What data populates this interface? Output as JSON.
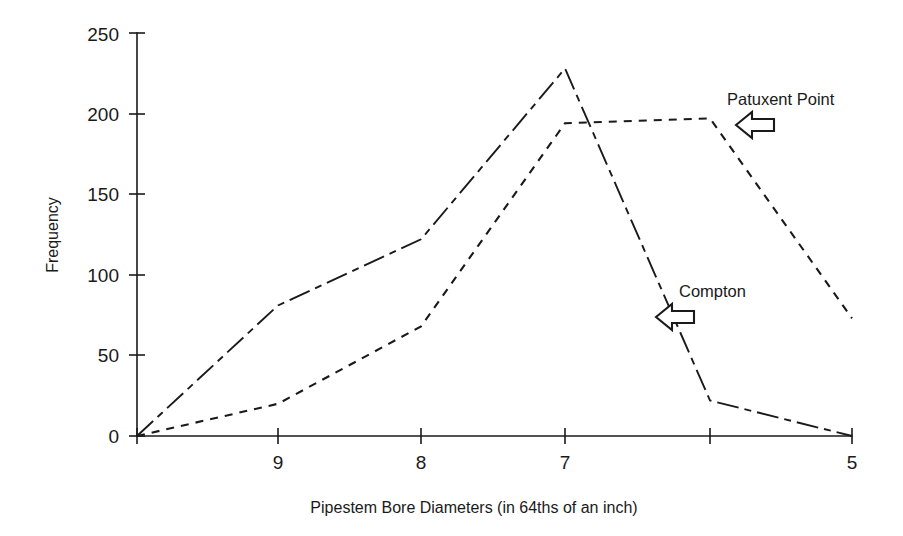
{
  "chart_data": {
    "type": "line",
    "title": "",
    "subtitle": "",
    "xlabel": "Pipestem Bore Diameters (in 64ths of an inch)",
    "ylabel": "Frequency",
    "grid": false,
    "legend_position": "inline-annotations",
    "xlim": [
      0,
      5
    ],
    "ylim": [
      0,
      250
    ],
    "yticks": [
      0,
      50,
      100,
      150,
      200,
      250
    ],
    "ytick_labels": [
      "0",
      "50",
      "100",
      "150",
      "200",
      "250"
    ],
    "x_positions": [
      0,
      1,
      2,
      3,
      4,
      5
    ],
    "xtick_labels": [
      "",
      "9",
      "8",
      "7",
      "",
      "5"
    ],
    "categories": [
      "",
      "9",
      "8",
      "7",
      "",
      "5"
    ],
    "series": [
      {
        "name": "Compton",
        "style": "dash-dot",
        "color": "#1a1a1a",
        "values": [
          0,
          81,
          122,
          228,
          22,
          0
        ]
      },
      {
        "name": "Patuxent Point",
        "style": "short-dash",
        "color": "#1a1a1a",
        "values": [
          0,
          20,
          68,
          194,
          197,
          73
        ]
      }
    ],
    "annotations": [
      {
        "label": "Patuxent Point",
        "icon": "left-block-arrow-icon",
        "text_x": 727,
        "text_y": 105,
        "arrow_x": 755,
        "arrow_y": 123
      },
      {
        "label": "Compton",
        "icon": "left-block-arrow-icon",
        "text_x": 679,
        "text_y": 297,
        "arrow_x": 673,
        "arrow_y": 315
      }
    ]
  },
  "geometry": {
    "plot_left": 137,
    "plot_right": 852,
    "plot_bottom": 436,
    "plot_top": 33,
    "x_pixels": [
      137,
      278,
      421,
      565,
      710,
      852
    ],
    "y_pixels": [
      436,
      355,
      275,
      194,
      114,
      33
    ]
  }
}
